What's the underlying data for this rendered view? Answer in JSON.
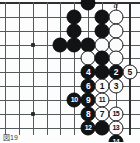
{
  "figure": {
    "caption": "図19",
    "kind": "go-board-diagram"
  },
  "board": {
    "cols": 10,
    "rows": 10,
    "edges": {
      "top": true,
      "right": true,
      "left": false,
      "bottom": false
    },
    "hoshi": [
      {
        "col": 2,
        "row": 3
      },
      {
        "col": 2,
        "row": 8
      }
    ]
  },
  "labels": [
    {
      "text": "a",
      "col": 8,
      "row": 0
    }
  ],
  "stones": [
    {
      "col": 6,
      "row": 0,
      "color": "black",
      "num": ""
    },
    {
      "col": 5,
      "row": 1,
      "color": "black",
      "num": ""
    },
    {
      "col": 7,
      "row": 1,
      "color": "black",
      "num": ""
    },
    {
      "col": 8,
      "row": 1,
      "color": "white",
      "num": ""
    },
    {
      "col": 5,
      "row": 2,
      "color": "black",
      "num": ""
    },
    {
      "col": 7,
      "row": 2,
      "color": "black",
      "num": ""
    },
    {
      "col": 8,
      "row": 2,
      "color": "white",
      "num": ""
    },
    {
      "col": 4,
      "row": 3,
      "color": "black",
      "num": ""
    },
    {
      "col": 5,
      "row": 3,
      "color": "black",
      "num": ""
    },
    {
      "col": 6,
      "row": 3,
      "color": "black",
      "num": ""
    },
    {
      "col": 7,
      "row": 3,
      "color": "white",
      "num": ""
    },
    {
      "col": 8,
      "row": 3,
      "color": "white",
      "num": ""
    },
    {
      "col": 6,
      "row": 4,
      "color": "white",
      "num": ""
    },
    {
      "col": 7,
      "row": 4,
      "color": "black",
      "num": ""
    },
    {
      "col": 8,
      "row": 4,
      "color": "white",
      "num": ""
    },
    {
      "col": 6,
      "row": 5,
      "color": "black",
      "num": "4"
    },
    {
      "col": 7,
      "row": 5,
      "color": "black",
      "num": ""
    },
    {
      "col": 8,
      "row": 5,
      "color": "black",
      "num": "2"
    },
    {
      "col": 9,
      "row": 5,
      "color": "white",
      "num": "5"
    },
    {
      "col": 6,
      "row": 6,
      "color": "black",
      "num": "6"
    },
    {
      "col": 7,
      "row": 6,
      "color": "white",
      "num": "1"
    },
    {
      "col": 8,
      "row": 6,
      "color": "white",
      "num": "3"
    },
    {
      "col": 5,
      "row": 7,
      "color": "black",
      "num": "10"
    },
    {
      "col": 6,
      "row": 7,
      "color": "black",
      "num": "9"
    },
    {
      "col": 7,
      "row": 7,
      "color": "white",
      "num": "11"
    },
    {
      "col": 6,
      "row": 8,
      "color": "black",
      "num": "8"
    },
    {
      "col": 7,
      "row": 8,
      "color": "white",
      "num": "7"
    },
    {
      "col": 8,
      "row": 8,
      "color": "white",
      "num": "15"
    },
    {
      "col": 6,
      "row": 9,
      "color": "black",
      "num": "12"
    },
    {
      "col": 7,
      "row": 9,
      "color": "black",
      "num": ""
    },
    {
      "col": 8,
      "row": 9,
      "color": "white",
      "num": "13"
    },
    {
      "col": 8,
      "row": 10,
      "color": "black",
      "num": "14"
    }
  ]
}
